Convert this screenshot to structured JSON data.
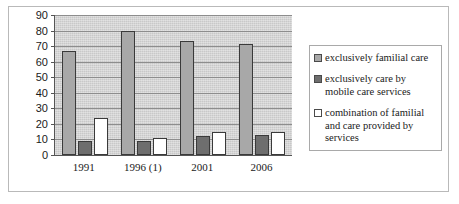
{
  "chart_data": {
    "type": "bar",
    "title": "",
    "subtitle": "",
    "xlabel": "",
    "ylabel": "",
    "categories": [
      "1991",
      "1996 (1)",
      "2001",
      "2006"
    ],
    "series": [
      {
        "name": "exclusively familial care",
        "color": "#a8a8a8",
        "values": [
          67,
          80,
          73,
          71.5
        ]
      },
      {
        "name": "exclusively care by mobile care services",
        "color": "#6e6e6e",
        "values": [
          9,
          9,
          12,
          13
        ]
      },
      {
        "name": "combination of familial and care provided by services",
        "color": "#ffffff",
        "values": [
          24,
          11,
          15,
          15
        ]
      }
    ],
    "ylim": [
      0,
      90
    ],
    "y_ticks": [
      0,
      10,
      20,
      30,
      40,
      50,
      60,
      70,
      80,
      90
    ],
    "y_tick_labels": [
      "0",
      "10",
      "20",
      "30",
      "40",
      "50",
      "60",
      "70",
      "80",
      "90"
    ],
    "grid": true,
    "grid_axis": "y",
    "legend_position": "right",
    "plot_background": "#c8c8c8",
    "axis_color": "#555555",
    "gridline_color": "#8d8d8d"
  },
  "legend": {
    "entries": [
      {
        "label": "exclusively familial care",
        "swatch": "legend-swatch-exclusively-familial-care"
      },
      {
        "label": "exclusively care by mobile care services",
        "swatch": "legend-swatch-exclusively-mobile-care"
      },
      {
        "label": "combination of familial and care provided by services",
        "swatch": "legend-swatch-combination"
      }
    ]
  }
}
